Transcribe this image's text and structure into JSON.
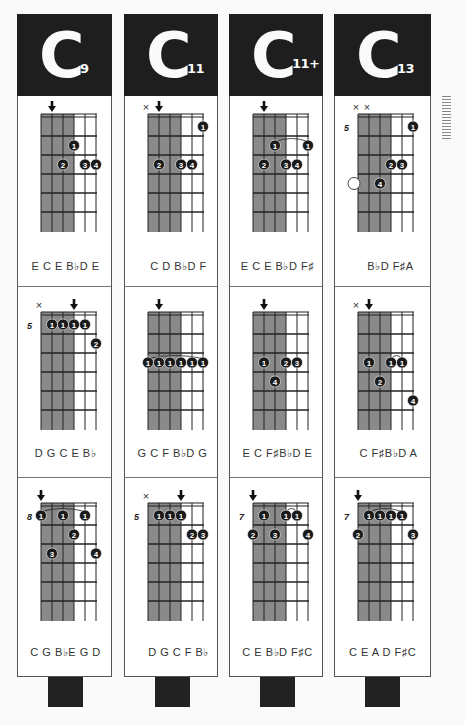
{
  "colors": {
    "header_bg": "#1e1e1e",
    "shade": "#8a8a8a",
    "dot": "#1a1a1a",
    "line": "#222"
  },
  "columns": [
    {
      "root": "C",
      "suffix": "9",
      "diagrams": [
        {
          "fret_label": "",
          "markers": [
            "",
            "arrow",
            "",
            "",
            "",
            ""
          ],
          "notes": "E C E B♭D E",
          "notes_offset": "top",
          "dots": [
            {
              "s": 3,
              "f": 2,
              "n": "1"
            },
            {
              "s": 2,
              "f": 3,
              "n": "2"
            },
            {
              "s": 4,
              "f": 3,
              "n": "3"
            },
            {
              "s": 5,
              "f": 3,
              "n": "4"
            }
          ],
          "barres": [],
          "open_circles": []
        },
        {
          "fret_label": "5",
          "markers": [
            "x",
            "",
            "",
            "arrow",
            "",
            ""
          ],
          "notes": "D G C E B♭",
          "notes_offset": "mid",
          "dots": [
            {
              "s": 1,
              "f": 1,
              "n": "1"
            },
            {
              "s": 2,
              "f": 1,
              "n": "1"
            },
            {
              "s": 3,
              "f": 1,
              "n": "1"
            },
            {
              "s": 4,
              "f": 1,
              "n": "1"
            },
            {
              "s": 5,
              "f": 2,
              "n": "2"
            }
          ],
          "barres": [],
          "open_circles": []
        },
        {
          "fret_label": "8",
          "markers": [
            "arrow",
            "",
            "",
            "",
            "",
            ""
          ],
          "notes": "C G B♭E G D",
          "notes_offset": "bottom",
          "dots": [
            {
              "s": 0,
              "f": 1,
              "n": "1"
            },
            {
              "s": 2,
              "f": 1,
              "n": "1"
            },
            {
              "s": 4,
              "f": 1,
              "n": "1"
            },
            {
              "s": 3,
              "f": 2,
              "n": "2"
            },
            {
              "s": 1,
              "f": 3,
              "n": "3"
            },
            {
              "s": 5,
              "f": 3,
              "n": "4"
            }
          ],
          "barres": [
            {
              "from": 0,
              "to": 4,
              "f": 1
            }
          ],
          "open_circles": []
        }
      ]
    },
    {
      "root": "C",
      "suffix": "11",
      "diagrams": [
        {
          "fret_label": "",
          "markers": [
            "x",
            "arrow",
            "",
            "",
            "",
            ""
          ],
          "notes": "C D B♭D F",
          "notes_offset": "top",
          "dots": [
            {
              "s": 5,
              "f": 1,
              "n": "1"
            },
            {
              "s": 1,
              "f": 3,
              "n": "2"
            },
            {
              "s": 3,
              "f": 3,
              "n": "3"
            },
            {
              "s": 4,
              "f": 3,
              "n": "4"
            }
          ],
          "barres": [],
          "open_circles": []
        },
        {
          "fret_label": "",
          "markers": [
            "",
            "arrow",
            "",
            "",
            "",
            ""
          ],
          "notes": "G C F B♭D G",
          "notes_offset": "mid",
          "dots": [
            {
              "s": 0,
              "f": 3,
              "n": "1"
            },
            {
              "s": 1,
              "f": 3,
              "n": "1"
            },
            {
              "s": 2,
              "f": 3,
              "n": "1"
            },
            {
              "s": 3,
              "f": 3,
              "n": "1"
            },
            {
              "s": 4,
              "f": 3,
              "n": "1"
            },
            {
              "s": 5,
              "f": 3,
              "n": "1"
            }
          ],
          "barres": [
            {
              "from": 0,
              "to": 5,
              "f": 3
            }
          ],
          "open_circles": []
        },
        {
          "fret_label": "5",
          "markers": [
            "x",
            "",
            "",
            "arrow",
            "",
            ""
          ],
          "notes": "D G C F B♭",
          "notes_offset": "bottom",
          "dots": [
            {
              "s": 1,
              "f": 1,
              "n": "1"
            },
            {
              "s": 2,
              "f": 1,
              "n": "1"
            },
            {
              "s": 3,
              "f": 1,
              "n": "1"
            },
            {
              "s": 4,
              "f": 2,
              "n": "2"
            },
            {
              "s": 5,
              "f": 2,
              "n": "3"
            }
          ],
          "barres": [],
          "open_circles": []
        }
      ]
    },
    {
      "root": "C",
      "suffix": "11+",
      "diagrams": [
        {
          "fret_label": "",
          "markers": [
            "",
            "arrow",
            "",
            "",
            "",
            ""
          ],
          "notes": "E C E B♭D F♯",
          "notes_offset": "top",
          "dots": [
            {
              "s": 2,
              "f": 2,
              "n": "1"
            },
            {
              "s": 5,
              "f": 2,
              "n": "1"
            },
            {
              "s": 1,
              "f": 3,
              "n": "2"
            },
            {
              "s": 3,
              "f": 3,
              "n": "3"
            },
            {
              "s": 4,
              "f": 3,
              "n": "4"
            }
          ],
          "barres": [
            {
              "from": 2,
              "to": 5,
              "f": 2
            }
          ],
          "open_circles": []
        },
        {
          "fret_label": "",
          "markers": [
            "",
            "arrow",
            "",
            "",
            "",
            ""
          ],
          "notes": "E C F♯B♭D E",
          "notes_offset": "mid",
          "dots": [
            {
              "s": 1,
              "f": 3,
              "n": "1"
            },
            {
              "s": 3,
              "f": 3,
              "n": "2"
            },
            {
              "s": 4,
              "f": 3,
              "n": "3"
            },
            {
              "s": 2,
              "f": 4,
              "n": "4"
            }
          ],
          "barres": [],
          "open_circles": []
        },
        {
          "fret_label": "7",
          "markers": [
            "arrow",
            "",
            "",
            "",
            "",
            ""
          ],
          "notes": "C E B♭D F♯C",
          "notes_offset": "bottom",
          "dots": [
            {
              "s": 1,
              "f": 1,
              "n": "1"
            },
            {
              "s": 3,
              "f": 1,
              "n": "1"
            },
            {
              "s": 4,
              "f": 1,
              "n": "1"
            },
            {
              "s": 0,
              "f": 2,
              "n": "2"
            },
            {
              "s": 2,
              "f": 2,
              "n": "3"
            },
            {
              "s": 5,
              "f": 2,
              "n": "4"
            }
          ],
          "barres": [
            {
              "from": 3,
              "to": 4,
              "f": 1
            }
          ],
          "open_circles": []
        }
      ]
    },
    {
      "root": "C",
      "suffix": "13",
      "diagrams": [
        {
          "fret_label": "5",
          "markers": [
            "x",
            "x",
            "",
            "",
            "",
            ""
          ],
          "notes": "B♭D F♯A",
          "notes_offset": "top",
          "dots": [
            {
              "s": 5,
              "f": 1,
              "n": "1"
            },
            {
              "s": 3,
              "f": 3,
              "n": "2"
            },
            {
              "s": 4,
              "f": 3,
              "n": "3"
            },
            {
              "s": 2,
              "f": 4,
              "n": "4"
            }
          ],
          "barres": [],
          "open_circles": [
            {
              "s": 0,
              "f": 4
            }
          ]
        },
        {
          "fret_label": "",
          "markers": [
            "x",
            "arrow",
            "",
            "",
            "",
            ""
          ],
          "notes": "C F♯B♭D A",
          "notes_offset": "mid",
          "dots": [
            {
              "s": 1,
              "f": 3,
              "n": "1"
            },
            {
              "s": 3,
              "f": 3,
              "n": "1"
            },
            {
              "s": 4,
              "f": 3,
              "n": "1"
            },
            {
              "s": 2,
              "f": 4,
              "n": "2"
            },
            {
              "s": 5,
              "f": 5,
              "n": "4"
            }
          ],
          "barres": [
            {
              "from": 3,
              "to": 4,
              "f": 3
            }
          ],
          "open_circles": []
        },
        {
          "fret_label": "7",
          "markers": [
            "arrow",
            "",
            "",
            "",
            "",
            ""
          ],
          "notes": "C E A D F♯C",
          "notes_offset": "bottom",
          "dots": [
            {
              "s": 1,
              "f": 1,
              "n": "1"
            },
            {
              "s": 2,
              "f": 1,
              "n": "1"
            },
            {
              "s": 3,
              "f": 1,
              "n": "1"
            },
            {
              "s": 4,
              "f": 1,
              "n": "1"
            },
            {
              "s": 0,
              "f": 2,
              "n": "2"
            },
            {
              "s": 5,
              "f": 2,
              "n": "3"
            }
          ],
          "barres": [
            {
              "from": 1,
              "to": 4,
              "f": 1
            }
          ],
          "open_circles": []
        }
      ]
    }
  ]
}
